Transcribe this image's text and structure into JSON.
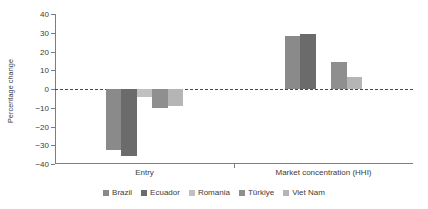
{
  "chart_data": {
    "type": "bar",
    "title": "",
    "xlabel": "",
    "ylabel": "Percentage change",
    "ylim": [
      -40,
      40
    ],
    "yticks": [
      40,
      30,
      20,
      10,
      0,
      -10,
      -20,
      -30,
      -40
    ],
    "ytick_labels": [
      "40",
      "30",
      "20",
      "10",
      "0",
      "−10",
      "−20",
      "−30",
      "−40"
    ],
    "categories": [
      "Entry",
      "Market concentration (HHI)"
    ],
    "grid": false,
    "zero_line": true,
    "legend_position": "bottom-center",
    "series": [
      {
        "name": "Brazil",
        "color": "#8a8a8a",
        "values": [
          -32.5,
          28.5
        ]
      },
      {
        "name": "Ecuador",
        "color": "#6b6b6b",
        "values": [
          -35.5,
          29.5
        ]
      },
      {
        "name": "Romania",
        "color": "#c0c0c0",
        "values": [
          -4.0,
          0.0
        ]
      },
      {
        "name": "Türkiye",
        "color": "#8f8f8f",
        "values": [
          -10.0,
          14.5
        ]
      },
      {
        "name": "Viet Nam",
        "color": "#b5b5b5",
        "values": [
          -9.0,
          6.5
        ]
      }
    ]
  },
  "axis": {
    "y_title": "Percentage change"
  },
  "legend": {
    "items": [
      {
        "label": "Brazil"
      },
      {
        "label": "Ecuador"
      },
      {
        "label": "Romania"
      },
      {
        "label": "Türkiye"
      },
      {
        "label": "Viet Nam"
      }
    ]
  }
}
